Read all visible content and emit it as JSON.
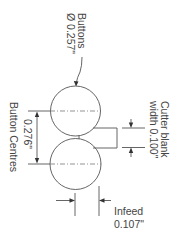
{
  "diagram": {
    "colors": {
      "line": "#555555",
      "text": "#444444",
      "background": "#ffffff"
    },
    "labels": {
      "buttons_line1": "Buttons",
      "buttons_line2": "Ø 0.257\"",
      "centres_value": "0.276\"",
      "centres_label": "Button Centres",
      "cutter_line1": "Cutter blank",
      "cutter_line2": "width 0.100\"",
      "infeed_line1": "Infeed",
      "infeed_line2": "0.107\""
    },
    "components": {
      "button_diameter": "0.257\"",
      "button_centres": "0.276\"",
      "cutter_blank_width": "0.100\"",
      "infeed": "0.107\""
    }
  }
}
